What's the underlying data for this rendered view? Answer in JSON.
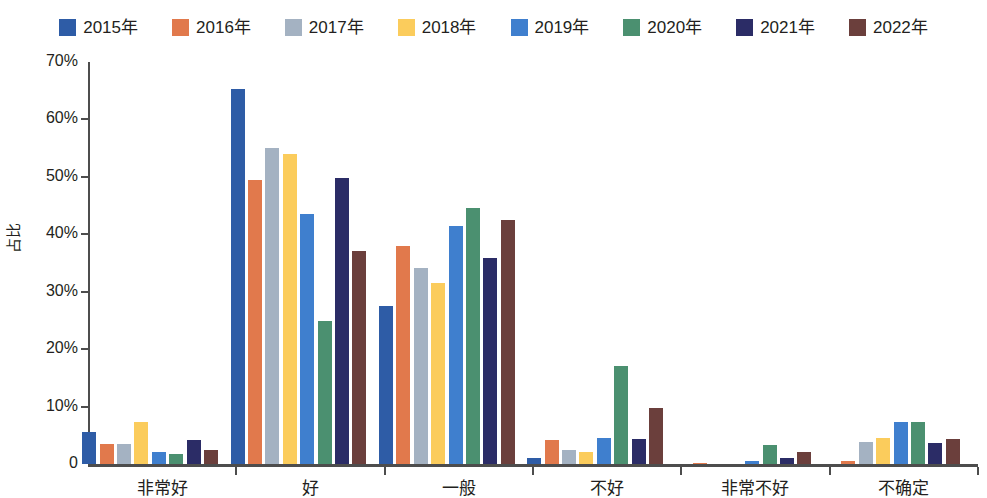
{
  "chart_data": {
    "type": "bar",
    "title": "",
    "xlabel": "",
    "ylabel": "占比",
    "ylim": [
      0,
      70
    ],
    "ytick_labels": [
      "0",
      "10%",
      "20%",
      "30%",
      "40%",
      "50%",
      "60%",
      "70%"
    ],
    "ytick_values": [
      0,
      10,
      20,
      30,
      40,
      50,
      60,
      70
    ],
    "grid": false,
    "legend_position": "top-center",
    "y_unit": "%",
    "categories": [
      "非常好",
      "好",
      "一般",
      "不好",
      "非常不好",
      "不确定"
    ],
    "series": [
      {
        "name": "2015年",
        "color": "#2e5ca6",
        "values": [
          5.6,
          65.3,
          27.5,
          1.1,
          0.0,
          0.0
        ]
      },
      {
        "name": "2016年",
        "color": "#e1794c",
        "values": [
          3.4,
          49.4,
          37.9,
          4.2,
          0.2,
          0.6
        ]
      },
      {
        "name": "2017年",
        "color": "#a4b2c2",
        "values": [
          3.4,
          55.1,
          34.1,
          2.5,
          0.0,
          3.8
        ]
      },
      {
        "name": "2018年",
        "color": "#fbcc5c",
        "values": [
          7.4,
          53.9,
          31.5,
          2.1,
          0.0,
          4.6
        ]
      },
      {
        "name": "2019年",
        "color": "#3f7fce",
        "values": [
          2.1,
          43.5,
          41.4,
          4.5,
          0.5,
          7.3
        ]
      },
      {
        "name": "2020年",
        "color": "#4b9070",
        "values": [
          1.7,
          24.9,
          44.6,
          17.1,
          3.3,
          7.4
        ]
      },
      {
        "name": "2021年",
        "color": "#2b2c66",
        "values": [
          4.1,
          49.8,
          35.9,
          4.4,
          1.0,
          3.7
        ]
      },
      {
        "name": "2022年",
        "color": "#6b3f3c",
        "values": [
          2.4,
          37.1,
          42.5,
          9.8,
          2.1,
          4.4
        ]
      }
    ]
  },
  "legend": {
    "items": [
      {
        "label": "2015年"
      },
      {
        "label": "2016年"
      },
      {
        "label": "2017年"
      },
      {
        "label": "2018年"
      },
      {
        "label": "2019年"
      },
      {
        "label": "2020年"
      },
      {
        "label": "2021年"
      },
      {
        "label": "2022年"
      }
    ]
  },
  "axes": {
    "y_title": "占比"
  }
}
